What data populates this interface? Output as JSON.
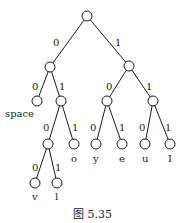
{
  "figure": {
    "caption": "图 5.35",
    "type": "binary code tree (Huffman tree)"
  },
  "tree": {
    "nodes": [
      {
        "id": "root",
        "x": 87,
        "y": 16
      },
      {
        "id": "n0",
        "x": 50,
        "y": 67
      },
      {
        "id": "n1",
        "x": 129,
        "y": 66
      },
      {
        "id": "n00",
        "x": 37,
        "y": 101,
        "leaf": "space"
      },
      {
        "id": "n01",
        "x": 61,
        "y": 101
      },
      {
        "id": "n10",
        "x": 107,
        "y": 101
      },
      {
        "id": "n11",
        "x": 153,
        "y": 101
      },
      {
        "id": "n010",
        "x": 48,
        "y": 144
      },
      {
        "id": "n011",
        "x": 74,
        "y": 144,
        "leaf": "o"
      },
      {
        "id": "n100",
        "x": 96,
        "y": 144,
        "leaf": "y"
      },
      {
        "id": "n101",
        "x": 122,
        "y": 144,
        "leaf": "e"
      },
      {
        "id": "n110",
        "x": 145,
        "y": 144,
        "leaf": "u"
      },
      {
        "id": "n111",
        "x": 170,
        "y": 144,
        "leaf": "I"
      },
      {
        "id": "n0100",
        "x": 35,
        "y": 183,
        "leaf": "v"
      },
      {
        "id": "n0101",
        "x": 57,
        "y": 183,
        "leaf": "l"
      }
    ],
    "edges": [
      {
        "from": "root",
        "to": "n0",
        "bit": "0"
      },
      {
        "from": "root",
        "to": "n1",
        "bit": "1"
      },
      {
        "from": "n0",
        "to": "n00",
        "bit": "0"
      },
      {
        "from": "n0",
        "to": "n01",
        "bit": "1"
      },
      {
        "from": "n1",
        "to": "n10",
        "bit": "0"
      },
      {
        "from": "n1",
        "to": "n11",
        "bit": "1"
      },
      {
        "from": "n01",
        "to": "n010",
        "bit": "0"
      },
      {
        "from": "n01",
        "to": "n011",
        "bit": "1"
      },
      {
        "from": "n10",
        "to": "n100",
        "bit": "0"
      },
      {
        "from": "n10",
        "to": "n101",
        "bit": "1"
      },
      {
        "from": "n11",
        "to": "n110",
        "bit": "0"
      },
      {
        "from": "n11",
        "to": "n111",
        "bit": "1"
      },
      {
        "from": "n010",
        "to": "n0100",
        "bit": "0"
      },
      {
        "from": "n010",
        "to": "n0101",
        "bit": "1"
      }
    ],
    "leaf_labels": [
      "space",
      "o",
      "y",
      "e",
      "u",
      "I",
      "v",
      "l"
    ],
    "edge_labels": {
      "root_left": "0",
      "root_right": "1",
      "n0_left": "0",
      "n0_right": "1",
      "n1_left": "0",
      "n1_right": "1",
      "n01_left": "0",
      "n01_right": "1",
      "n10_left": "0",
      "n10_right": "1",
      "n11_left": "0",
      "n11_right": "1",
      "n010_left": "0",
      "n010_right": "1"
    }
  }
}
